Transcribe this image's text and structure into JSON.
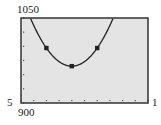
{
  "chart_data": {
    "type": "line",
    "title": "",
    "xlabel": "",
    "ylabel": "",
    "xlim": [
      5,
      15
    ],
    "ylim": [
      900,
      1050
    ],
    "x_tick_step": 1,
    "y_tick_step": 25,
    "window_labels": {
      "ymax": "1050",
      "ymin": "900",
      "xmin": "5",
      "xmax": "1"
    },
    "series": [
      {
        "name": "parabola",
        "equation": "y = 8(x-9)^2 + 965",
        "x": [
          5.74,
          6,
          7,
          8,
          9,
          10,
          11,
          12,
          12.26
        ],
        "values": [
          1050,
          1037,
          997,
          973,
          965,
          973,
          997,
          1037,
          1050
        ]
      }
    ],
    "marked_points": [
      {
        "x": 7,
        "y": 997
      },
      {
        "x": 9,
        "y": 965
      },
      {
        "x": 11,
        "y": 997
      }
    ],
    "grid": false,
    "legend": null,
    "colors": {
      "background": "#e4e4e4",
      "frame": "#333333",
      "curve": "#222222",
      "tick": "#555555"
    }
  }
}
